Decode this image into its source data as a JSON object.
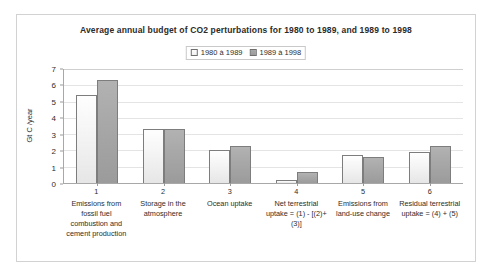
{
  "figure": {
    "title": "Average annual budget of CO2 perturbations for 1980 to 1989, and 1989 to 1998"
  },
  "legend": {
    "entries": [
      {
        "label": "1980 à 1989",
        "swatch": "series-light-swatch"
      },
      {
        "label": "1989 à 1998",
        "swatch": "series-dark-swatch"
      }
    ]
  },
  "axes": {
    "ylabel": "Gt C /year",
    "yticks": [
      "0",
      "1",
      "2",
      "3",
      "4",
      "5",
      "6",
      "7"
    ]
  },
  "categories_detail": [
    {
      "num": "1",
      "text": "Emissions from fossil fuel combustion and cement production"
    },
    {
      "num": "2",
      "text": "Storage in the atmosphere"
    },
    {
      "num": "3",
      "text": "Ocean uptake"
    },
    {
      "num": "4",
      "text": "Net terrestrial uptake = (1) - [(2)+(3)]"
    },
    {
      "num": "5",
      "text": "Emissions from land-use change"
    },
    {
      "num": "6",
      "text": "Residual terrestrial uptake = (4) + (5)"
    }
  ],
  "chart_data": {
    "type": "bar",
    "title": "Average annual budget of CO2 perturbations for 1980 to 1989, and 1989 to 1998",
    "xlabel": "",
    "ylabel": "Gt C /year",
    "ylim": [
      0,
      7
    ],
    "ytick_step": 1,
    "grid": true,
    "legend_position": "top-center",
    "categories": [
      "1 Emissions from fossil fuel combustion and cement production",
      "2 Storage in the atmosphere",
      "3 Ocean uptake",
      "4 Net terrestrial uptake = (1) - [(2)+(3)]",
      "5 Emissions from land-use change",
      "6 Residual terrestrial uptake = (4) + (5)"
    ],
    "series": [
      {
        "name": "1980 à 1989",
        "values": [
          5.4,
          3.3,
          2.0,
          0.2,
          1.7,
          1.9
        ]
      },
      {
        "name": "1989 à 1998",
        "values": [
          6.3,
          3.3,
          2.3,
          0.7,
          1.6,
          2.3
        ]
      }
    ],
    "colors": {
      "series_light": "#f2f2f2",
      "series_dark": "#a6a6a6",
      "border": "#7d7d7d"
    }
  }
}
